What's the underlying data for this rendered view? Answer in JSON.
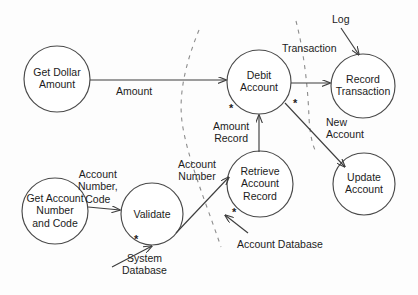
{
  "diagram": {
    "type": "data-flow-diagram",
    "colors": {
      "background": "#fdfdfd",
      "stroke": "#3d3d3d",
      "circle_stroke": "#4a4a4a",
      "boundary_stroke": "#8c8c8c",
      "text": "#1c1c1c"
    },
    "processes": [
      {
        "id": "get-dollar-amount",
        "label": "Get Dollar\nAmount",
        "cx": 57,
        "cy": 79,
        "r": 33
      },
      {
        "id": "debit-account",
        "label": "Debit\nAccount",
        "cx": 259,
        "cy": 82,
        "r": 32
      },
      {
        "id": "record-transaction",
        "label": "Record\nTransaction",
        "cx": 363,
        "cy": 86,
        "r": 32
      },
      {
        "id": "update-account",
        "label": "Update\nAccount",
        "cx": 364,
        "cy": 184,
        "r": 31
      },
      {
        "id": "get-account-number-and-code",
        "label": "Get Account\nNumber\nand Code",
        "cx": 55,
        "cy": 211,
        "r": 33
      },
      {
        "id": "validate",
        "label": "Validate",
        "cx": 152,
        "cy": 214,
        "r": 31
      },
      {
        "id": "retrieve-account-record",
        "label": "Retrieve\nAccount\nRecord",
        "cx": 260,
        "cy": 184,
        "r": 33
      }
    ],
    "flow_labels": [
      {
        "id": "amount",
        "text": "Amount",
        "x": 116,
        "y": 85
      },
      {
        "id": "transaction",
        "text": "Transaction",
        "x": 282,
        "y": 42
      },
      {
        "id": "log",
        "text": "Log",
        "x": 332,
        "y": 13
      },
      {
        "id": "new-account",
        "text": "New\nAccount",
        "x": 326,
        "y": 116
      },
      {
        "id": "amount-record",
        "text": "Amount\nRecord",
        "x": 213,
        "y": 120
      },
      {
        "id": "account-number-code",
        "text": "Account\nNumber,\nCode",
        "x": 78,
        "y": 168
      },
      {
        "id": "account-number",
        "text": "Account\nNumber",
        "x": 178,
        "y": 158
      },
      {
        "id": "system-database",
        "text": "System\nDatabase",
        "x": 122,
        "y": 252
      },
      {
        "id": "account-database",
        "text": "Account Database",
        "x": 237,
        "y": 238
      }
    ],
    "star_marks": [
      {
        "id": "star-debit-account",
        "x": 229,
        "y": 103
      },
      {
        "id": "star-debit-to-record",
        "x": 293,
        "y": 98
      },
      {
        "id": "star-validate",
        "x": 134,
        "y": 234
      },
      {
        "id": "star-retrieve-account-record",
        "x": 232,
        "y": 207
      }
    ]
  }
}
